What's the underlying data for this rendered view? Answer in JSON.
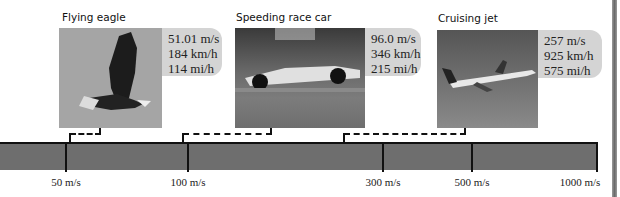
{
  "items": [
    {
      "title": "Flying eagle",
      "speeds": [
        "51.01 m/s",
        "184 km/h",
        "114 mi/h"
      ],
      "icon": "eagle-photo"
    },
    {
      "title": "Speeding race car",
      "speeds": [
        "96.0 m/s",
        "346 km/h",
        "215 mi/h"
      ],
      "icon": "race-car-photo"
    },
    {
      "title": "Cruising jet",
      "speeds": [
        "257 m/s",
        "925 km/h",
        "575 mi/h"
      ],
      "icon": "jet-photo"
    }
  ],
  "scale": {
    "ticks": [
      "50 m/s",
      "100 m/s",
      "300 m/s",
      "500 m/s",
      "1000 m/s"
    ],
    "bar_color": "#6e6e6e",
    "callout_color": "#d4d4d4"
  }
}
